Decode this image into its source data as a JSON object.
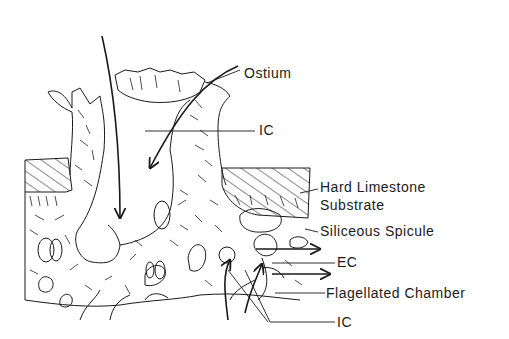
{
  "diagram": {
    "labels": {
      "ostium": "Ostium",
      "ic_top": "IC",
      "hard_limestone_line1": "Hard Limestone",
      "hard_limestone_line2": "Substrate",
      "siliceous_spicule": "Siliceous Spicule",
      "ec": "EC",
      "flagellated_chamber": "Flagellated Chamber",
      "ic_bottom": "IC"
    },
    "colors": {
      "ink": "#1a1a1a",
      "background": "#ffffff"
    }
  }
}
